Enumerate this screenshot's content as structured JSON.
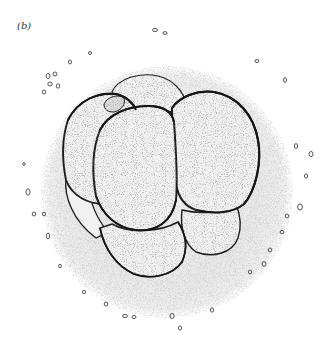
{
  "figure": {
    "panel_label": "(b)",
    "colors": {
      "ink": "#1a1a1a",
      "stipple": "#9a9a9a",
      "halo": "#e6e6e6",
      "background": "#ffffff"
    }
  }
}
